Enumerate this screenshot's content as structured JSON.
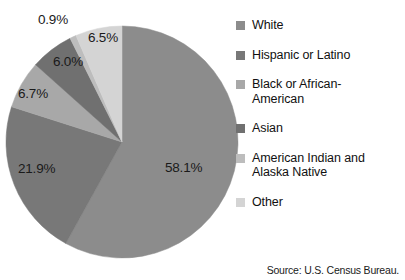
{
  "source_note": "Source: U.S. Census Bureau.",
  "legend": {
    "items": [
      {
        "label": "White",
        "color": "#8c8c8c",
        "swatch_name": "legend-swatch-white"
      },
      {
        "label": "Hispanic or Latino",
        "color": "#787878",
        "swatch_name": "legend-swatch-hispanic-or-latino"
      },
      {
        "label": "Black or African-\nAmerican",
        "color": "#a8a8a8",
        "swatch_name": "legend-swatch-black-or-african-american"
      },
      {
        "label": "Asian",
        "color": "#707070",
        "swatch_name": "legend-swatch-asian"
      },
      {
        "label": "American Indian and\nAlaska Native",
        "color": "#bdbdbd",
        "swatch_name": "legend-swatch-american-indian-and-alaska-native"
      },
      {
        "label": "Other",
        "color": "#d4d4d4",
        "swatch_name": "legend-swatch-other"
      }
    ]
  },
  "labels": {
    "white": "58.1%",
    "hispanic": "21.9%",
    "black": "6.7%",
    "asian": "6.0%",
    "american_indian": "0.9%",
    "other": "6.5%"
  },
  "chart_data": {
    "type": "pie",
    "title": "",
    "categories": [
      "White",
      "Hispanic or Latino",
      "Black or African-American",
      "Asian",
      "American Indian and Alaska Native",
      "Other"
    ],
    "values": [
      58.1,
      21.9,
      6.7,
      6.0,
      0.9,
      6.5
    ],
    "value_labels": [
      "58.1%",
      "21.9%",
      "6.7%",
      "6.0%",
      "0.9%",
      "6.5%"
    ],
    "colors": [
      "#8c8c8c",
      "#787878",
      "#a8a8a8",
      "#707070",
      "#bdbdbd",
      "#d4d4d4"
    ],
    "units": "percent",
    "start_angle_deg": 0,
    "direction": "clockwise",
    "legend_position": "right",
    "grid": false,
    "annotations": [
      "Source: U.S. Census Bureau."
    ]
  }
}
